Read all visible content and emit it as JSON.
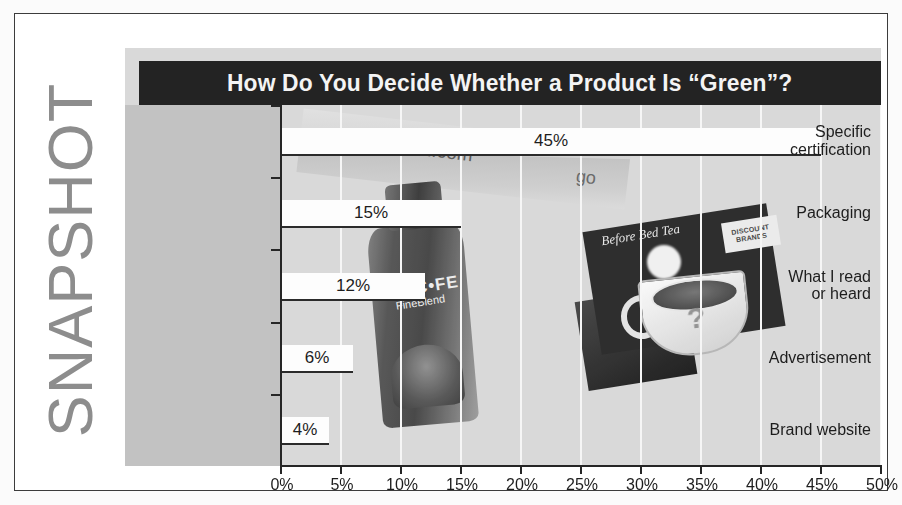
{
  "sidebar": {
    "wordmark": "SNAPSHOT"
  },
  "chart_panel": {
    "title": "How Do You Decide Whether a Product Is “Green”?"
  },
  "background_art": {
    "banner_url_text": "www.gogreen.com",
    "banner_go_text": "go",
    "jar_brand": "NESC•FE",
    "jar_variant": "FineBlend",
    "discount_chip_text": "DISCOUNT BRANDS",
    "card_script_text": "Before Bed Tea",
    "cup_question_mark": "?"
  },
  "colors": {
    "panel_background": "#d9d9d9",
    "label_band": "#c2c2c2",
    "title_bar": "#232323",
    "title_text": "#f4f4f4",
    "bar_fill": "#fdfdfd",
    "bar_edge": "#2b2b2b",
    "axis": "#262626",
    "gridline": "#f6f6f6",
    "wordmark": "#8d8d8d",
    "page_background": "#ffffff"
  },
  "chart_data": {
    "type": "bar",
    "orientation": "horizontal",
    "title": "How Do You Decide Whether a Product Is “Green”?",
    "xlabel": "",
    "ylabel": "",
    "categories": [
      "Specific certification",
      "Packaging",
      "What I read or heard",
      "Advertisement",
      "Brand website"
    ],
    "category_label_lines": [
      [
        "Specific",
        "certification"
      ],
      [
        "Packaging"
      ],
      [
        "What I read",
        "or heard"
      ],
      [
        "Advertisement"
      ],
      [
        "Brand website"
      ]
    ],
    "values": [
      45,
      15,
      12,
      6,
      4
    ],
    "value_labels": [
      "45%",
      "15%",
      "12%",
      "6%",
      "4%"
    ],
    "xlim": [
      0,
      50
    ],
    "xtick_values": [
      0,
      5,
      10,
      15,
      20,
      25,
      30,
      35,
      40,
      45,
      50
    ],
    "xtick_labels": [
      "0%",
      "5%",
      "10%",
      "15%",
      "20%",
      "25%",
      "30%",
      "35%",
      "40%",
      "45%",
      "50%"
    ],
    "grid": "vertical-only",
    "legend": "none"
  }
}
